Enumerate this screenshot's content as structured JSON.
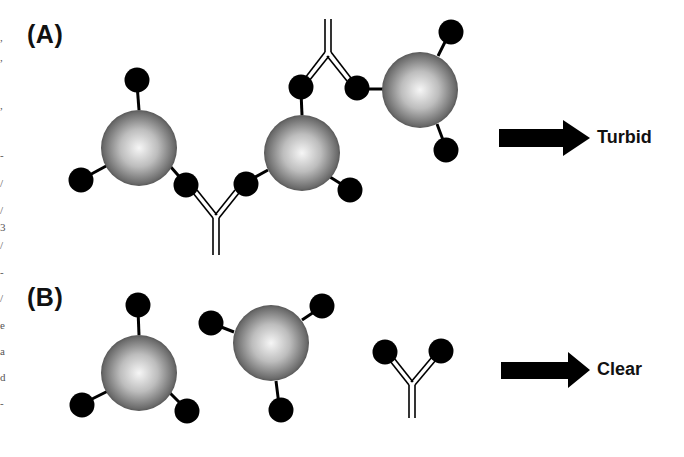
{
  "panels": [
    {
      "id": "A",
      "label": "(A)",
      "outcome": "Turbid",
      "description": "Antigen-coated particles crosslinked by antibodies (agglutination)"
    },
    {
      "id": "B",
      "label": "(B)",
      "outcome": "Clear",
      "description": "Antigen-coated particles and free antibody, no crosslinking"
    }
  ],
  "colors": {
    "ink": "#000000",
    "sphere_highlight": "#f4f4f4",
    "sphere_shadow": "#3a3a3a",
    "background": "#ffffff"
  },
  "margin_fragments": [
    ",",
    ",",
    ",",
    "-",
    "/",
    "/",
    "3",
    "/",
    "-",
    "/",
    "e",
    "a",
    "d",
    "-"
  ]
}
